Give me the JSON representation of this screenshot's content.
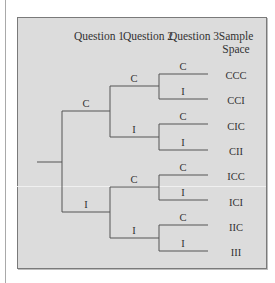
{
  "headers": {
    "q1": "Question 1",
    "q2": "Question 2",
    "q3": "Question 3",
    "sample_line1": "Sample",
    "sample_line2": "Space"
  },
  "tree": {
    "level1": [
      {
        "label": "C"
      },
      {
        "label": "I"
      }
    ],
    "level2": [
      {
        "label": "C"
      },
      {
        "label": "I"
      },
      {
        "label": "C"
      },
      {
        "label": "I"
      }
    ],
    "level3": [
      {
        "label": "C"
      },
      {
        "label": "I"
      },
      {
        "label": "C"
      },
      {
        "label": "I"
      },
      {
        "label": "C"
      },
      {
        "label": "I"
      },
      {
        "label": "C"
      },
      {
        "label": "I"
      }
    ]
  },
  "sample_space": [
    "CCC",
    "CCI",
    "CIC",
    "CII",
    "ICC",
    "ICI",
    "IIC",
    "III"
  ],
  "colors": {
    "panel_fill": "#dcdcdc",
    "panel_border": "#7a7a7a",
    "line": "#555555",
    "text": "#333333"
  }
}
